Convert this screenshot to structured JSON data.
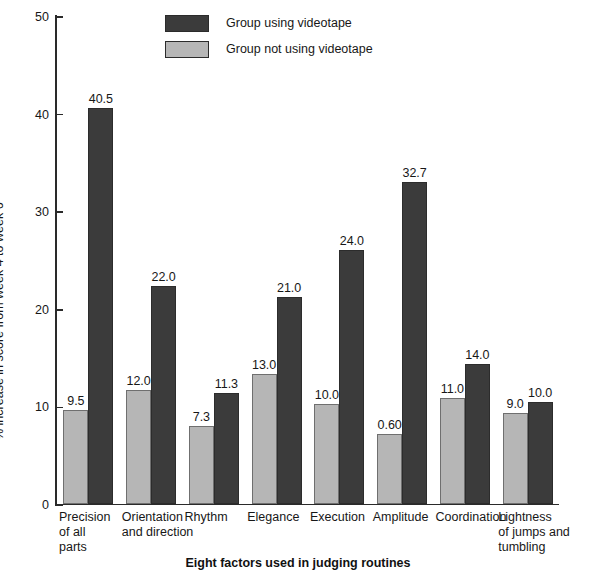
{
  "chart_data": {
    "type": "bar",
    "title": "",
    "xlabel": "Eight factors used in judging routines",
    "ylabel": "% increase in score from week 4 to week 6",
    "ylim": [
      0,
      50
    ],
    "yticks": [
      0,
      10,
      20,
      30,
      40,
      50
    ],
    "ytick_labels": [
      "0",
      "10",
      "20",
      "30",
      "40",
      "50"
    ],
    "grid": false,
    "legend_position": "top-center",
    "categories": [
      "Precision of all parts",
      "Orientation and direction",
      "Rhythm",
      "Elegance",
      "Execution",
      "Amplitude",
      "Coordination",
      "Lightness of jumps and tumbling"
    ],
    "category_lines": [
      [
        "Precision",
        "of all",
        "parts"
      ],
      [
        "Orientation",
        "and direction"
      ],
      [
        "Rhythm"
      ],
      [
        "Elegance"
      ],
      [
        "Execution"
      ],
      [
        "Amplitude"
      ],
      [
        "Coordination"
      ],
      [
        "Lightness",
        "of jumps and",
        "tumbling"
      ]
    ],
    "series": [
      {
        "name": "Group not using videotape",
        "color": "#b6b6b6",
        "labels": [
          "9.5",
          "12.0",
          "7.3",
          "13.0",
          "10.0",
          "0.60",
          "11.0",
          "9.0"
        ],
        "values": [
          9.5,
          12.0,
          7.3,
          13.0,
          10.0,
          0.6,
          11.0,
          9.0
        ],
        "plotted_heights": [
          9.6,
          11.6,
          7.9,
          13.3,
          10.2,
          7.1,
          10.8,
          9.3
        ]
      },
      {
        "name": "Group using videotape",
        "color": "#3b3b3b",
        "labels": [
          "40.5",
          "22.0",
          "11.3",
          "21.0",
          "24.0",
          "32.7",
          "14.0",
          "10.0"
        ],
        "values": [
          40.5,
          22.0,
          11.3,
          21.0,
          24.0,
          32.7,
          14.0,
          10.0
        ],
        "plotted_heights": [
          40.5,
          22.3,
          11.3,
          21.2,
          26.0,
          32.9,
          14.3,
          10.4
        ]
      }
    ]
  },
  "legend": {
    "items": [
      {
        "label": "Group using videotape",
        "color": "#3b3b3b"
      },
      {
        "label": "Group not using videotape",
        "color": "#b6b6b6"
      }
    ]
  },
  "axes": {
    "y_title": "% increase in score from week 4 to week 6",
    "x_title": "Eight factors used in judging routines",
    "y_tick_labels": [
      "50",
      "40",
      "30",
      "20",
      "10",
      "0"
    ]
  }
}
